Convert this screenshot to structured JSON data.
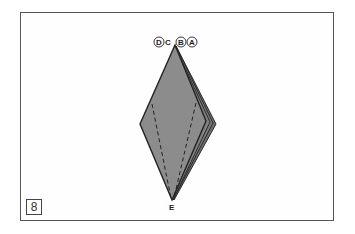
{
  "figure": {
    "step_number": "8",
    "labels": {
      "top": [
        "D",
        "C",
        "B",
        "A"
      ],
      "circled": [
        "D",
        "B",
        "A"
      ],
      "bottom": "E"
    },
    "colors": {
      "fill": "#8a8a8a",
      "edge": "#2a2a2a",
      "frame": "#555555"
    }
  }
}
